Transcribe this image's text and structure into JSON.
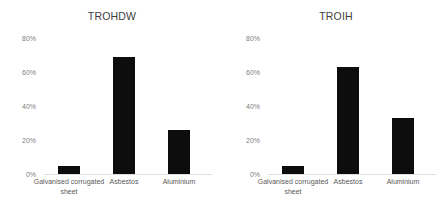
{
  "figure": {
    "background": "#ffffff",
    "bar_color": "#0d0d0d",
    "axis_label_color": "#808080"
  },
  "panels": [
    {
      "key": "trohdw",
      "title": "TROHDW"
    },
    {
      "key": "troih",
      "title": "TROIH"
    }
  ],
  "chart_data": [
    {
      "type": "bar",
      "title": "TROHDW",
      "categories": [
        "Galvanised corrugated sheet",
        "Asbestos",
        "Aluminium"
      ],
      "values": [
        5,
        69,
        26
      ],
      "xlabel": "",
      "ylabel": "",
      "ylim": [
        0,
        80
      ],
      "yticks": [
        0,
        20,
        40,
        60,
        80
      ],
      "ytick_labels": [
        "0%",
        "20%",
        "40%",
        "60%",
        "80%"
      ],
      "grid": false,
      "legend": false
    },
    {
      "type": "bar",
      "title": "TROIH",
      "categories": [
        "Galvanised corrugated sheet",
        "Asbestos",
        "Aluminium"
      ],
      "values": [
        5,
        63,
        33
      ],
      "xlabel": "",
      "ylabel": "",
      "ylim": [
        0,
        80
      ],
      "yticks": [
        0,
        20,
        40,
        60,
        80
      ],
      "ytick_labels": [
        "0%",
        "20%",
        "40%",
        "60%",
        "80%"
      ],
      "grid": false,
      "legend": false
    }
  ]
}
